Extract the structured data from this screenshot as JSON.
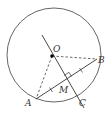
{
  "diagram": {
    "type": "circle-geometry",
    "colors": {
      "circle": "#555555",
      "line": "#333333",
      "dashed": "#444444",
      "point": "#000000"
    },
    "circle": {
      "center": [
        54,
        55
      ],
      "radius": 47
    },
    "points": {
      "O": {
        "label": "O",
        "x": 52,
        "y": 56
      },
      "A": {
        "label": "A",
        "x": 36,
        "y": 99
      },
      "B": {
        "label": "B",
        "x": 97,
        "y": 59
      },
      "C": {
        "label": "C",
        "x": 77,
        "y": 95
      },
      "M": {
        "label": "M",
        "x": 67,
        "y": 80
      }
    },
    "segments": [
      {
        "from": "A",
        "to": "B",
        "style": "solid"
      },
      {
        "from": "O",
        "to": "A",
        "style": "dashed"
      },
      {
        "from": "O",
        "to": "B",
        "style": "dashed"
      },
      {
        "from": "line-start",
        "to": "line-end",
        "style": "solid",
        "through": [
          "O",
          "M",
          "C"
        ]
      }
    ],
    "annotations": {
      "right_angle_at": "M",
      "equal_ticks": [
        "AM",
        "MB"
      ]
    }
  }
}
